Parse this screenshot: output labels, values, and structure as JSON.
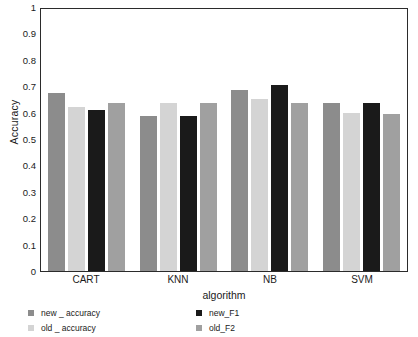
{
  "chart_data": {
    "type": "bar",
    "title": "",
    "xlabel": "algorithm",
    "ylabel": "Accuracy",
    "categories": [
      "CART",
      "KNN",
      "NB",
      "SVM"
    ],
    "ylim": [
      0,
      1
    ],
    "yticks": [
      "1",
      "0.9",
      "0.8",
      "0.7",
      "0.6",
      "0.5",
      "0.4",
      "0.3",
      "0.2",
      "0.1",
      "0"
    ],
    "ytick_values": [
      1,
      0.9,
      0.8,
      0.7,
      0.6,
      0.5,
      0.4,
      0.3,
      0.2,
      0.1,
      0
    ],
    "grid": false,
    "legend_position": "bottom",
    "series": [
      {
        "name": "new _ accuracy",
        "color": "#8c8c8c",
        "values": [
          0.678,
          0.59,
          0.69,
          0.64
        ]
      },
      {
        "name": "old _ accuracy",
        "color": "#d4d4d4",
        "values": [
          0.625,
          0.64,
          0.655,
          0.605
        ]
      },
      {
        "name": "new_F1",
        "color": "#1a1a1a",
        "values": [
          0.613,
          0.593,
          0.71,
          0.64
        ]
      },
      {
        "name": "old_F2",
        "color": "#a0a0a0",
        "values": [
          0.64,
          0.64,
          0.64,
          0.6
        ]
      }
    ]
  },
  "axes": {
    "frame_color": "#2b2b2b"
  }
}
